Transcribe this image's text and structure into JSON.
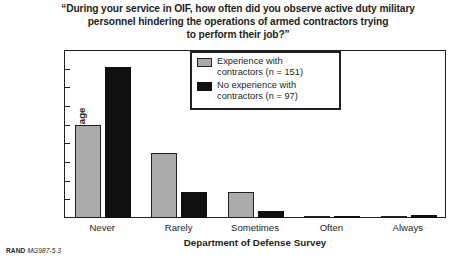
{
  "figure": {
    "title_lines": [
      "“During your service in OIF, how often did you observe active duty military",
      "personnel hindering the operations of armed contractors trying",
      "to perform their job?”"
    ],
    "footer": {
      "organization": "RAND",
      "figure_code": "MG987-5.3"
    },
    "colors": {
      "series_1": "#ababab",
      "series_2": "#0f0f0f",
      "axis": "#231f20",
      "background": "#ffffff"
    }
  },
  "chart_data": {
    "type": "bar",
    "title": "“During your service in OIF, how often did you observe active duty military personnel hindering the operations of armed contractors trying to perform their job?”",
    "xlabel": "Department of Defense Survey",
    "ylabel": "Percentage",
    "categories": [
      "Never",
      "Rarely",
      "Sometimes",
      "Often",
      "Always"
    ],
    "series": [
      {
        "name": "Experience with contractors (n = 151)",
        "color": "#ababab",
        "values": [
          50,
          35,
          14,
          1,
          0.5
        ]
      },
      {
        "name": "No experience with contractors (n = 97)",
        "color": "#0f0f0f",
        "values": [
          81,
          14,
          4,
          0.8,
          1.5
        ]
      }
    ],
    "ylim": [
      0,
      90
    ],
    "yticks": [
      0,
      10,
      20,
      30,
      40,
      50,
      60,
      70,
      80,
      90
    ],
    "ytick_labels": [
      "0",
      "10",
      "20",
      "30",
      "40",
      "50",
      "60",
      "70",
      "80",
      "90"
    ],
    "grid": false,
    "legend_position": "upper center"
  },
  "legend": {
    "entries": [
      {
        "line1": "Experience with",
        "line2": "contractors (n = 151)"
      },
      {
        "line1": "No experience with",
        "line2": "contractors (n = 97)"
      }
    ]
  }
}
